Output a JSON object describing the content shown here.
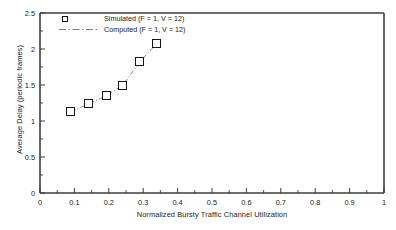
{
  "chart_data": {
    "type": "scatter",
    "title": "",
    "xlabel": "Normalized Bursty Traffic Channel Utilization",
    "ylabel": "Average Delay (periodic frames)",
    "xlim": [
      0,
      1
    ],
    "ylim": [
      0,
      2.5
    ],
    "xticks": [
      "0",
      "0.1",
      "0.2",
      "0.3",
      "0.4",
      "0.5",
      "0.6",
      "0.7",
      "0.8",
      "0.9",
      "1"
    ],
    "xtick_values": [
      0,
      0.1,
      0.2,
      0.3,
      0.4,
      0.5,
      0.6,
      0.7,
      0.8,
      0.9,
      1
    ],
    "yticks": [
      "0",
      "0.5",
      "1",
      "1.5",
      "2",
      "2.5"
    ],
    "ytick_values": [
      0,
      0.5,
      1,
      1.5,
      2,
      2.5
    ],
    "grid": false,
    "legend_position": "top-left",
    "legend": [
      {
        "label": "Simulated (F = 1, V = 12)",
        "style": "open-square-marker"
      },
      {
        "label": "Computed (F = 1, V = 12)",
        "style": "dash-dot-line"
      }
    ],
    "series": [
      {
        "name": "Simulated (F = 1, V = 12)",
        "style": "open-square-marker",
        "x": [
          0.09,
          0.142,
          0.192,
          0.241,
          0.29,
          0.34
        ],
        "values": [
          1.13,
          1.24,
          1.35,
          1.5,
          1.82,
          2.08
        ]
      },
      {
        "name": "Computed (F = 1, V = 12)",
        "style": "dash-dot-line",
        "x": [
          0.09,
          0.142,
          0.192,
          0.241,
          0.29,
          0.34
        ],
        "values": [
          1.13,
          1.24,
          1.35,
          1.5,
          1.82,
          2.08
        ]
      }
    ]
  },
  "axes": {
    "color": "#222222",
    "line_color": "#4a4a4a",
    "marker_color": "#151515"
  }
}
